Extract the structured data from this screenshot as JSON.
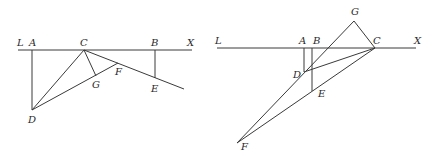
{
  "figures": [
    {
      "id": "left",
      "points": {
        "L": [
          18,
          50
        ],
        "X": [
          192,
          50
        ],
        "A": [
          32,
          50
        ],
        "C": [
          84,
          50
        ],
        "B": [
          155,
          50
        ],
        "D": [
          32,
          110
        ],
        "G": [
          96,
          76
        ],
        "F": [
          118,
          63
        ],
        "E": [
          155,
          78
        ],
        "CE_end": [
          184,
          89
        ]
      },
      "segments": [
        [
          "L",
          "X"
        ],
        [
          "A",
          "D"
        ],
        [
          "B",
          "E"
        ],
        [
          "C",
          "D"
        ],
        [
          "D",
          "F"
        ],
        [
          "C",
          "G"
        ],
        [
          "C",
          "CE_end"
        ]
      ],
      "labels": [
        {
          "text": "L",
          "x": 17,
          "y": 46
        },
        {
          "text": "A",
          "x": 29,
          "y": 46
        },
        {
          "text": "C",
          "x": 80,
          "y": 46
        },
        {
          "text": "B",
          "x": 151,
          "y": 46
        },
        {
          "text": "X",
          "x": 187,
          "y": 46
        },
        {
          "text": "F",
          "x": 115,
          "y": 75
        },
        {
          "text": "G",
          "x": 92,
          "y": 88
        },
        {
          "text": "E",
          "x": 151,
          "y": 92
        },
        {
          "text": "D",
          "x": 28,
          "y": 123
        }
      ]
    },
    {
      "id": "right",
      "points": {
        "L": [
          217,
          48
        ],
        "X": [
          416,
          48
        ],
        "A": [
          304,
          48
        ],
        "B": [
          312,
          48
        ],
        "C": [
          375,
          48
        ],
        "G": [
          354,
          21
        ],
        "D": [
          304,
          72
        ],
        "E": [
          312,
          91
        ],
        "F": [
          237,
          143
        ]
      },
      "segments": [
        [
          "L",
          "X"
        ],
        [
          "A",
          "D"
        ],
        [
          "B",
          "E"
        ],
        [
          "D",
          "C"
        ],
        [
          "F",
          "G"
        ],
        [
          "G",
          "C"
        ],
        [
          "F",
          "C"
        ]
      ],
      "labels": [
        {
          "text": "L",
          "x": 215,
          "y": 44
        },
        {
          "text": "G",
          "x": 351,
          "y": 15
        },
        {
          "text": "A",
          "x": 299,
          "y": 44
        },
        {
          "text": "B",
          "x": 313,
          "y": 44
        },
        {
          "text": "C",
          "x": 373,
          "y": 44
        },
        {
          "text": "X",
          "x": 414,
          "y": 44
        },
        {
          "text": "D",
          "x": 293,
          "y": 78
        },
        {
          "text": "E",
          "x": 318,
          "y": 97
        },
        {
          "text": "F",
          "x": 241,
          "y": 150
        }
      ]
    }
  ]
}
